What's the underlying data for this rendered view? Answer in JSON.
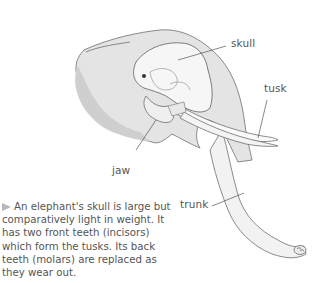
{
  "diagram": {
    "labels": {
      "skull": "skull",
      "tusk": "tusk",
      "jaw": "jaw",
      "trunk": "trunk"
    },
    "caption": "An elephant's skull is large but comparatively light in weight. It has two front teeth (incisors) which form the tusks. Its back teeth (molars) are replaced as they wear out.",
    "caption_marker": "triangle-arrow-icon",
    "colors": {
      "head_fill": "#e6e6e6",
      "head_shadow": "#cfcfcf",
      "skull_fill": "#f7f7f7",
      "outline": "#6e6e6e",
      "leader_line": "#555555",
      "text": "#555555"
    }
  }
}
